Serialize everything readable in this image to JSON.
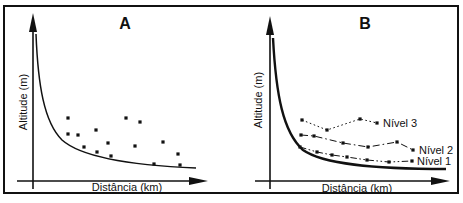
{
  "figure": {
    "ink_color": "#111111",
    "background": "#ffffff",
    "panels": [
      {
        "title": "A",
        "x_axis_label": "Distância (km)",
        "y_axis_label": "Altitude (m)",
        "scatter_points": [
          [
            68,
            118
          ],
          [
            68,
            134
          ],
          [
            78,
            135
          ],
          [
            84,
            147
          ],
          [
            96,
            130
          ],
          [
            97,
            152
          ],
          [
            108,
            143
          ],
          [
            111,
            156
          ],
          [
            126,
            118
          ],
          [
            135,
            146
          ],
          [
            140,
            122
          ],
          [
            154,
            164
          ],
          [
            163,
            142
          ],
          [
            178,
            154
          ],
          [
            180,
            165
          ]
        ]
      },
      {
        "title": "B",
        "x_axis_label": "Distância (km)",
        "y_axis_label": "Altitude (m)",
        "series": [
          {
            "name": "Nível 3",
            "line_style": "dotted",
            "points": [
              [
                302,
                120
              ],
              [
                327,
                130
              ],
              [
                360,
                119
              ],
              [
                377,
                123
              ]
            ],
            "label_pos": [
              383,
              127
            ]
          },
          {
            "name": "Nível 2",
            "line_style": "dash-dot",
            "points": [
              [
                301,
                135
              ],
              [
                314,
                136
              ],
              [
                343,
                143
              ],
              [
                368,
                147
              ],
              [
                397,
                142
              ],
              [
                413,
                150
              ]
            ],
            "label_pos": [
              419,
              154
            ]
          },
          {
            "name": "Nível 1",
            "line_style": "dash-dot-dot",
            "points": [
              [
                300,
                147
              ],
              [
                317,
                152
              ],
              [
                332,
                155
              ],
              [
                347,
                157
              ],
              [
                367,
                160
              ],
              [
                389,
                162
              ],
              [
                412,
                161
              ]
            ],
            "label_pos": [
              417,
              165
            ]
          }
        ]
      }
    ]
  },
  "chart_data": [
    {
      "type": "scatter",
      "title": "A",
      "xlabel": "Distância (km)",
      "ylabel": "Altitude (m)",
      "description": "Schematic decay curve of altitude vs distance with 15 unconnected scatter sample points above the curve; axes have no numeric ticks.",
      "points_px": [
        [
          68,
          118
        ],
        [
          68,
          134
        ],
        [
          78,
          135
        ],
        [
          84,
          147
        ],
        [
          96,
          130
        ],
        [
          97,
          152
        ],
        [
          108,
          143
        ],
        [
          111,
          156
        ],
        [
          126,
          118
        ],
        [
          135,
          146
        ],
        [
          140,
          122
        ],
        [
          154,
          164
        ],
        [
          163,
          142
        ],
        [
          178,
          154
        ],
        [
          180,
          165
        ]
      ]
    },
    {
      "type": "line",
      "title": "B",
      "xlabel": "Distância (km)",
      "ylabel": "Altitude (m)",
      "description": "Same schematic decay curve with three stepped marker lines labelled Nível 3 (dotted), Nível 2 (dash-dot) and Nível 1 (dash-dot-dot); axes have no numeric ticks.",
      "series": [
        {
          "name": "Nível 3",
          "points_px": [
            [
              302,
              120
            ],
            [
              327,
              130
            ],
            [
              360,
              119
            ],
            [
              377,
              123
            ]
          ]
        },
        {
          "name": "Nível 2",
          "points_px": [
            [
              301,
              135
            ],
            [
              314,
              136
            ],
            [
              343,
              143
            ],
            [
              368,
              147
            ],
            [
              397,
              142
            ],
            [
              413,
              150
            ]
          ]
        },
        {
          "name": "Nível 1",
          "points_px": [
            [
              300,
              147
            ],
            [
              317,
              152
            ],
            [
              332,
              155
            ],
            [
              347,
              157
            ],
            [
              367,
              160
            ],
            [
              389,
              162
            ],
            [
              412,
              161
            ]
          ]
        }
      ]
    }
  ]
}
